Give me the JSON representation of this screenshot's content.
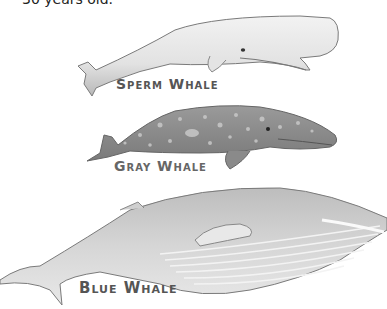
{
  "caption": {
    "text": "30 years old."
  },
  "whales": [
    {
      "id": "sperm",
      "label": "Sperm Whale"
    },
    {
      "id": "gray",
      "label": "Gray Whale"
    },
    {
      "id": "blue",
      "label": "Blue Whale"
    }
  ],
  "colors": {
    "sperm_body": "#e6e6e6",
    "gray_body": "#8e8e8e",
    "blue_body": "#cfcfcf",
    "outline": "#6a6a6a"
  }
}
